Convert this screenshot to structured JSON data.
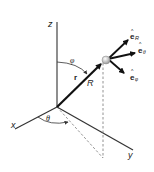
{
  "figure": {
    "type": "spherical-coordinates-diagram",
    "axes": {
      "x": "x",
      "y": "y",
      "z": "z"
    },
    "angles": {
      "polar": "φ",
      "azimuthal": "θ"
    },
    "vector": {
      "name": "r",
      "magnitude": "R"
    },
    "unit_vectors": [
      {
        "symbol": "e",
        "hat": "^",
        "subscript": "R"
      },
      {
        "symbol": "e",
        "hat": "^",
        "subscript": "θ"
      },
      {
        "symbol": "e",
        "hat": "^",
        "subscript": "φ"
      }
    ]
  }
}
